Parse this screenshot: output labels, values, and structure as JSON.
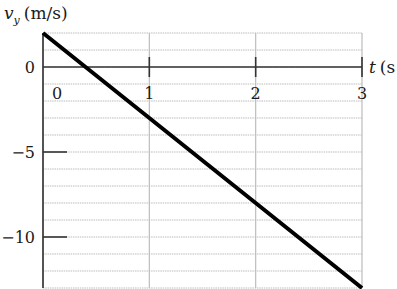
{
  "chart_data": {
    "type": "line",
    "title": "",
    "xlabel": "t (s)",
    "ylabel": "v_y (m/s)",
    "ylabel_main": "v",
    "ylabel_sub": "y",
    "ylabel_unit": "(m/s)",
    "xlabel_var": "t",
    "xlabel_unit": "(s",
    "xlim": [
      0,
      3
    ],
    "ylim": [
      -13,
      2
    ],
    "x_ticks": [
      0,
      1,
      2,
      3
    ],
    "x_tick_labels": [
      "0",
      "1",
      "2",
      "3"
    ],
    "y_ticks": [
      0,
      -5,
      -10
    ],
    "y_tick_labels": [
      "0",
      "−5",
      "−10"
    ],
    "grid": {
      "x_step": 1,
      "y_step": 1,
      "on": true
    },
    "series": [
      {
        "name": "v_y(t)",
        "x": [
          0,
          1,
          2,
          3
        ],
        "values": [
          2,
          -3,
          -8,
          -13
        ],
        "color": "#000000"
      }
    ]
  },
  "colors": {
    "grid": "#bdbdbd",
    "axis": "#333333",
    "line": "#000000"
  }
}
